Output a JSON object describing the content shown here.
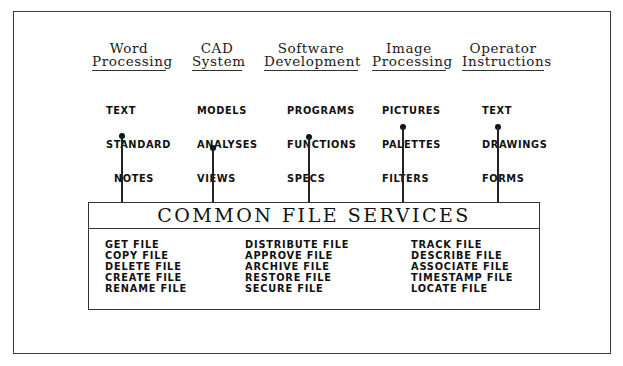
{
  "diagram": {
    "columns": [
      {
        "header": [
          "Word",
          "Processing"
        ],
        "items": [
          "TEXT",
          "STANDARD",
          "  NOTES",
          "FORMS"
        ]
      },
      {
        "header": [
          "CAD",
          "System"
        ],
        "items": [
          "MODELS",
          "ANALYSES",
          "VIEWS",
          "SPECS",
          "NOTES"
        ]
      },
      {
        "header": [
          "Software",
          "Development"
        ],
        "items": [
          "PROGRAMS",
          "FUNCTIONS",
          "SPECS",
          "SCREENS"
        ]
      },
      {
        "header": [
          "Image",
          "Processing"
        ],
        "items": [
          "PICTURES",
          "PALETTES",
          "FILTERS"
        ]
      },
      {
        "header": [
          "Operator",
          "Instructions"
        ],
        "items": [
          "TEXT",
          "DRAWINGS",
          "FORMS"
        ]
      }
    ],
    "services": {
      "title": "COMMON FILE SERVICES",
      "columns": [
        [
          "GET FILE",
          "COPY FILE",
          "DELETE FILE",
          "CREATE FILE",
          "RENAME FILE"
        ],
        [
          "DISTRIBUTE FILE",
          "APPROVE FILE",
          "ARCHIVE FILE",
          "RESTORE FILE",
          "SECURE FILE"
        ],
        [
          "TRACK FILE",
          "DESCRIBE FILE",
          "ASSOCIATE FILE",
          "TIMESTAMP FILE",
          "LOCATE FILE"
        ]
      ]
    }
  }
}
